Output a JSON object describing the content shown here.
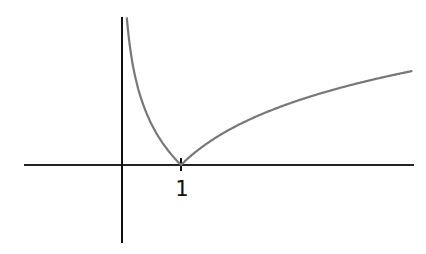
{
  "chart_data": {
    "type": "line",
    "title": "",
    "xlabel": "",
    "ylabel": "",
    "function": "y = |ln x|",
    "xlim": [
      -1.67,
      4.93
    ],
    "ylim": [
      -1.32,
      2.51
    ],
    "tick_labels": [
      "1"
    ],
    "grid": false,
    "legend": null,
    "series": [
      {
        "name": "|ln x|",
        "x": [
          0.08,
          0.1,
          0.2,
          0.3,
          0.5,
          0.7,
          1.0,
          1.5,
          2.0,
          2.5,
          3.0,
          3.5,
          4.0,
          4.5,
          4.93
        ],
        "y": [
          2.53,
          2.3,
          1.61,
          1.2,
          0.69,
          0.36,
          0.0,
          0.41,
          0.69,
          0.92,
          1.1,
          1.25,
          1.39,
          1.5,
          1.6
        ]
      }
    ],
    "colors": {
      "axis": "#111111",
      "curve": "#777777"
    }
  },
  "axes": {
    "x_tick_label": "1"
  }
}
